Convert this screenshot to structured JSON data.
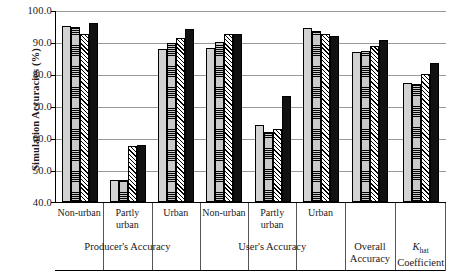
{
  "chart_data": {
    "type": "bar",
    "title": "",
    "xlabel": "",
    "ylabel": "Simulation Accuracies (%)",
    "ylim": [
      40.0,
      100.0
    ],
    "ytick_labels": [
      "100.0",
      "90.0",
      "80.0",
      "70.0",
      "60.0",
      "50.0",
      "40.0"
    ],
    "ytick_values": [
      100.0,
      90.0,
      80.0,
      70.0,
      60.0,
      50.0,
      40.0
    ],
    "grid": true,
    "legend_position": "none",
    "categories": [
      "Non-urban",
      "Partly urban",
      "Urban",
      "Non-urban",
      "Partly urban",
      "Urban",
      "Overall Accuracy",
      "K_hat Coefficient"
    ],
    "super_groups": [
      {
        "label": "Producer's  Accuracy",
        "span": 3
      },
      {
        "label": "User's Accuracy",
        "span": 3
      },
      {
        "label": "Overall Accuracy",
        "span": 1
      },
      {
        "label": "K_hat Coefficient",
        "span": 1
      }
    ],
    "series": [
      {
        "name": "series-1",
        "pattern": "solid-light-gray",
        "values": [
          95.3,
          46.8,
          88.0,
          88.4,
          64.0,
          94.7,
          87.0,
          77.3
        ]
      },
      {
        "name": "series-2",
        "pattern": "horizontal-hatch-gray",
        "values": [
          94.9,
          46.7,
          89.8,
          90.2,
          62.0,
          93.6,
          87.2,
          77.0
        ]
      },
      {
        "name": "series-3",
        "pattern": "diagonal-hatch",
        "values": [
          92.7,
          57.5,
          91.3,
          92.8,
          62.7,
          92.8,
          89.0,
          80.2
        ]
      },
      {
        "name": "series-4",
        "pattern": "solid-black",
        "values": [
          96.1,
          57.8,
          94.2,
          92.6,
          73.2,
          92.2,
          90.8,
          83.6
        ]
      }
    ]
  },
  "axis": {
    "y_title": "Simulation Accuracies (%)"
  },
  "x_labels": {
    "g0": "Non-urban",
    "g1_line1": "Partly",
    "g1_line2": "urban",
    "g2": "Urban",
    "g3": "Non-urban",
    "g4_line1": "Partly",
    "g4_line2": "urban",
    "g5": "Urban",
    "g6_line1": "Overall",
    "g6_line2": "Accuracy",
    "g7_line1": "K",
    "g7_sub": "hat",
    "g7_line2": "Coefficient"
  },
  "super_labels": {
    "s0": "Producer's  Accuracy",
    "s1": "User's Accuracy"
  },
  "colors": {
    "series_1": "#d2d2d2",
    "series_2": "#c9c9c9",
    "series_3": "#ffffff",
    "series_4": "#111111",
    "gridline": "#9a9a9a",
    "axis": "#000000"
  }
}
